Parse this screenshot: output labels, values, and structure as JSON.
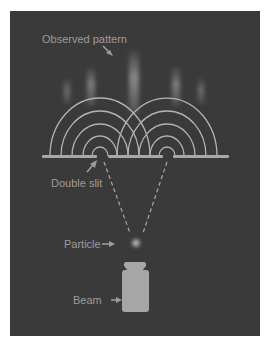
{
  "diagram": {
    "labels": {
      "observed_pattern": "Observed pattern",
      "double_slit": "Double slit",
      "particle": "Particle",
      "beam": "Beam"
    },
    "colors": {
      "background": "#3a3a3a",
      "wave_arcs": "#b3b3b3",
      "barrier": "#a8a8a8",
      "label_text": "#9c9c9c",
      "beam": "#a6a6a6",
      "fringe": "#c8c8c8"
    },
    "slits": [
      {
        "x": 100,
        "y": 156
      },
      {
        "x": 167,
        "y": 156
      }
    ],
    "fringes_x": [
      67,
      91,
      134,
      176,
      201
    ],
    "wave_arc_count_per_slit": 5
  }
}
